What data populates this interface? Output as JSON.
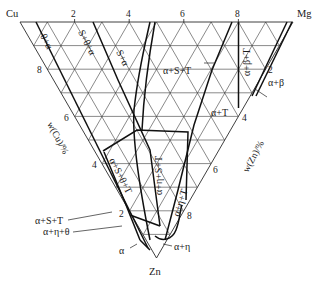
{
  "diagram": {
    "type": "ternary-phase-diagram",
    "corners": {
      "top_left": "Cu",
      "top_right": "Mg",
      "bottom": "Zn"
    },
    "top_axis_ticks": [
      "2",
      "4",
      "6",
      "8"
    ],
    "left_axis_ticks": [
      "8",
      "6",
      "4",
      "2"
    ],
    "right_axis_ticks": [
      "2",
      "4",
      "6",
      "8"
    ],
    "left_axis_label": "w(Cu)/%",
    "right_axis_label": "w(Zn)/%",
    "regions": {
      "theta_alpha": "θ+α",
      "s_theta_alpha": "S+θ+α",
      "s_alpha": "S+α",
      "alpha_s_t_top": "α+S+T",
      "alpha_beta_t": "α+β+T",
      "alpha_beta": "α+β",
      "alpha_t": "α+T",
      "alpha_s_theta_t": "α+S+θ+T",
      "alpha_eta_s_t": "α+η+S+T",
      "alpha_eta_t": "α+η+T",
      "alpha_s_t_left": "α+S+T",
      "alpha_eta_theta": "α+η+θ",
      "alpha_eta": "α+η",
      "alpha": "α"
    }
  }
}
